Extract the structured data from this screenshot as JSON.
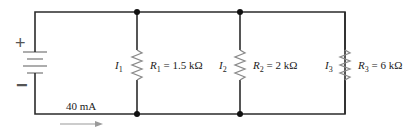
{
  "diagram": {
    "type": "parallel-circuit",
    "source": {
      "positive_sign": "+",
      "negative_sign": "−",
      "total_current": "40 mA"
    },
    "branches": [
      {
        "current_symbol": "I",
        "current_sub": "1",
        "resistor_symbol": "R",
        "resistor_sub": "1",
        "equals": " = ",
        "value": "1.5 kΩ"
      },
      {
        "current_symbol": "I",
        "current_sub": "2",
        "resistor_symbol": "R",
        "resistor_sub": "2",
        "equals": " = ",
        "value": "2 kΩ"
      },
      {
        "current_symbol": "I",
        "current_sub": "3",
        "resistor_symbol": "R",
        "resistor_sub": "3",
        "equals": " = ",
        "value": "6 kΩ"
      }
    ],
    "colors": {
      "wire": "#2b2b2b",
      "component": "#8a8a8a",
      "node": "#111111",
      "arrow": "#9a9a9a"
    }
  }
}
